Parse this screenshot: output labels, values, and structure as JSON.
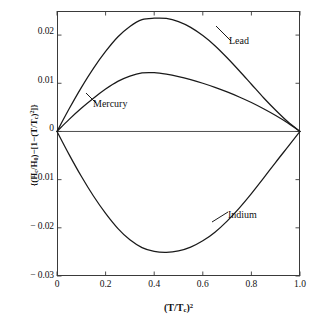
{
  "chart_data": {
    "type": "line",
    "title": "",
    "subtitle": "",
    "xlabel": "(T/T_c)^2",
    "xlabel_parts": {
      "open": "(T/T",
      "sub": "c",
      "close": ")",
      "sup": "2"
    },
    "ylabel": "{(H_c/H_0)-[1-(T/T_c)^2]}",
    "ylabel_parts": {
      "p1": "{(H",
      "s1": "c",
      "p2": "/H",
      "s2": "0",
      "p3": ")−[1−(T/T",
      "s3": "c",
      "p4": ")",
      "sup1": "2",
      "p5": "]}"
    },
    "xlim": [
      0.0,
      1.0
    ],
    "ylim": [
      -0.03,
      0.025
    ],
    "grid": false,
    "legend_position": "inline-annotations",
    "xticks": [
      0.0,
      0.2,
      0.4,
      0.6,
      0.8,
      1.0
    ],
    "xticklabels": [
      "0",
      "0.2",
      "0.4",
      "0.6",
      "0.8",
      "1.0"
    ],
    "yticks": [
      0.02,
      0.01,
      0.0,
      -0.01,
      -0.02,
      -0.03
    ],
    "yticklabels": [
      "0.02",
      "0.01",
      "0",
      "− 0.01",
      "− 0.02",
      "− 0.03"
    ],
    "zero_line": true,
    "axis_color": "#3a3a3a",
    "curve_color": "#1a1a1a",
    "background": "#ffffff",
    "x": [
      0.0,
      0.05,
      0.1,
      0.15,
      0.2,
      0.25,
      0.3,
      0.35,
      0.4,
      0.45,
      0.5,
      0.55,
      0.6,
      0.65,
      0.7,
      0.75,
      0.8,
      0.85,
      0.9,
      0.95,
      1.0
    ],
    "series": [
      {
        "name": "Lead",
        "label": "Lead",
        "peak_x": 0.43,
        "peak_y": 0.0235,
        "values": [
          0.0,
          0.0047,
          0.0091,
          0.0131,
          0.0166,
          0.0196,
          0.0218,
          0.0232,
          0.0235,
          0.02345,
          0.0228,
          0.0216,
          0.0199,
          0.0178,
          0.0153,
          0.0126,
          0.0098,
          0.007,
          0.0044,
          0.002,
          0.0
        ]
      },
      {
        "name": "Mercury",
        "label": "Mercury",
        "peak_x": 0.36,
        "peak_y": 0.0122,
        "values": [
          0.0,
          0.0025,
          0.0048,
          0.0069,
          0.0088,
          0.0104,
          0.0115,
          0.01215,
          0.0122,
          0.0119,
          0.0114,
          0.01075,
          0.01,
          0.00915,
          0.0082,
          0.00715,
          0.006,
          0.0047,
          0.0033,
          0.00175,
          0.0
        ]
      },
      {
        "name": "Indium",
        "label": "Indium",
        "peak_x": 0.45,
        "peak_y": -0.0251,
        "values": [
          0.0,
          -0.0048,
          -0.0093,
          -0.0134,
          -0.017,
          -0.0201,
          -0.0225,
          -0.0241,
          -0.0249,
          -0.0251,
          -0.0248,
          -0.024,
          -0.0227,
          -0.0209,
          -0.0186,
          -0.0159,
          -0.0129,
          -0.0097,
          -0.0064,
          -0.0032,
          0.0
        ]
      }
    ],
    "annotations": [
      {
        "text": "Lead",
        "for": "Lead"
      },
      {
        "text": "Mercury",
        "for": "Mercury"
      },
      {
        "text": "Indium",
        "for": "Indium"
      }
    ]
  }
}
